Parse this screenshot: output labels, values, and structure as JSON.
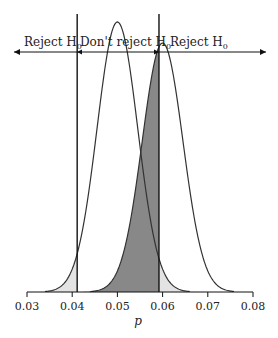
{
  "chart_data": {
    "type": "line",
    "title": "",
    "xlabel": "p",
    "ylabel": "",
    "xlim": [
      0.03,
      0.08
    ],
    "x_ticks": [
      "0.03",
      "0.04",
      "0.05",
      "0.06",
      "0.07",
      "0.08"
    ],
    "series": [
      {
        "name": "Null distribution",
        "mean": 0.05,
        "sd": 0.0045
      },
      {
        "name": "Alternative distribution",
        "mean": 0.06,
        "sd": 0.0045
      }
    ],
    "critical_values": [
      0.0411,
      0.0592
    ],
    "regions": [
      {
        "label": "Reject H0",
        "range": [
          0.03,
          0.0411
        ]
      },
      {
        "label": "Don't reject H0",
        "range": [
          0.0411,
          0.0592
        ]
      },
      {
        "label": "Reject H0",
        "range": [
          0.0592,
          0.08
        ]
      }
    ],
    "shading": {
      "alpha_tails": "#e3e3e3",
      "beta_area": "#888888"
    }
  },
  "labels": {
    "reject_left": "Reject H",
    "dont_reject": "Don't reject H",
    "reject_right": "Reject H",
    "sub": "0",
    "xlabel": "p"
  }
}
